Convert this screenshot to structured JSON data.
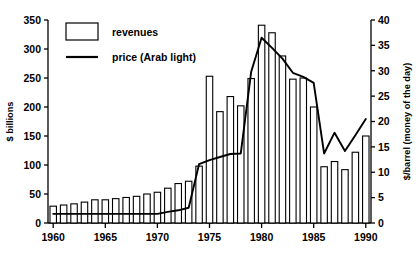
{
  "chart_data": {
    "type": "bar",
    "title": "",
    "xlabel": "",
    "ylabel": "$ billions",
    "y2label": "$/barrel (money of the day)",
    "ylim": [
      0,
      350
    ],
    "y2lim": [
      0,
      40
    ],
    "xlim": [
      1959.5,
      1990.5
    ],
    "grid": false,
    "legend_position": "top-left",
    "y_ticks": [
      0,
      50,
      100,
      150,
      200,
      250,
      300,
      350
    ],
    "y2_ticks": [
      0,
      5,
      10,
      15,
      20,
      25,
      30,
      35,
      40
    ],
    "x_ticks": [
      1960,
      1965,
      1970,
      1975,
      1980,
      1985,
      1990
    ],
    "x_tick_labels": [
      "1960",
      "1965",
      "1970",
      "1975",
      "1980",
      "1985",
      "1990"
    ],
    "categories": [
      1960,
      1961,
      1962,
      1963,
      1964,
      1965,
      1966,
      1967,
      1968,
      1969,
      1970,
      1971,
      1972,
      1973,
      1974,
      1975,
      1976,
      1977,
      1978,
      1979,
      1980,
      1981,
      1982,
      1983,
      1984,
      1985,
      1986,
      1987,
      1988,
      1989,
      1990
    ],
    "series": [
      {
        "name": "revenues",
        "type": "bar",
        "axis": "left",
        "unit": "$ billions",
        "values": [
          29,
          31,
          33,
          36,
          40,
          40,
          42,
          44,
          46,
          50,
          53,
          60,
          68,
          72,
          98,
          253,
          192,
          218,
          202,
          249,
          341,
          328,
          288,
          248,
          250,
          200,
          97,
          106,
          92,
          122,
          150
        ]
      },
      {
        "name": "price (Arab light)",
        "type": "line",
        "axis": "right",
        "unit": "$/barrel",
        "values": [
          1.8,
          1.8,
          1.8,
          1.8,
          1.8,
          1.8,
          1.8,
          1.8,
          1.8,
          1.8,
          1.8,
          2.2,
          2.5,
          3.0,
          11.6,
          12.4,
          13.0,
          13.6,
          13.7,
          29.8,
          36.5,
          34.5,
          32.4,
          29.6,
          28.8,
          27.6,
          13.7,
          17.8,
          14.2,
          17.3,
          20.5
        ]
      }
    ]
  },
  "legend": {
    "items": [
      {
        "label": "revenues",
        "marker": "open-rectangle"
      },
      {
        "label": "price (Arab light)",
        "marker": "line"
      }
    ]
  },
  "axes": {
    "left_title": "$ billions",
    "right_title": "$/barrel (money of the day)"
  }
}
